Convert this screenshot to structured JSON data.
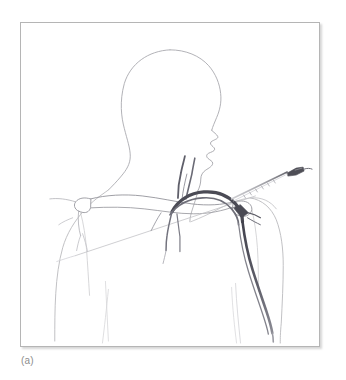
{
  "figure": {
    "caption": "(a)",
    "panel_label": "(a)",
    "frame": {
      "border_color": "#b5b5b5",
      "background_color": "#ffffff",
      "shadow_color": "rgba(0,0,0,0.16)",
      "x": 20,
      "y": 22,
      "width": 300,
      "height": 325
    },
    "colors": {
      "body_outline": "#b9b9bd",
      "body_outline_faint": "#d3d3d6",
      "bone_outline": "#9a9a9e",
      "vessel_dark": "#4b4b55",
      "vessel_mid": "#6f6f79",
      "needle": "#a9a9ae",
      "needle_hub": "#4e4e56",
      "guide_line": "#c2c2c6",
      "caption_text": "#8d8d8d"
    },
    "parts": [
      {
        "id": "head",
        "label": "Head and face in three-quarter profile facing right"
      },
      {
        "id": "neck",
        "label": "Neck"
      },
      {
        "id": "left-shoulder",
        "label": "Shoulder (viewer left)"
      },
      {
        "id": "right-shoulder",
        "label": "Shoulder (viewer right)"
      },
      {
        "id": "torso",
        "label": "Upper chest and torso outline"
      },
      {
        "id": "clavicle",
        "label": "Clavicle"
      },
      {
        "id": "scapula-acromion",
        "label": "Acromion and scapular spine"
      },
      {
        "id": "subclavian-vessels",
        "label": "Subclavian vein and artery"
      },
      {
        "id": "jugular-vessels",
        "label": "Internal jugular vessels"
      },
      {
        "id": "catheter",
        "label": "Catheter descending the chest"
      },
      {
        "id": "needle",
        "label": "Insertion needle with hub"
      },
      {
        "id": "guide-line",
        "label": "Oblique landmark guide line"
      }
    ]
  }
}
